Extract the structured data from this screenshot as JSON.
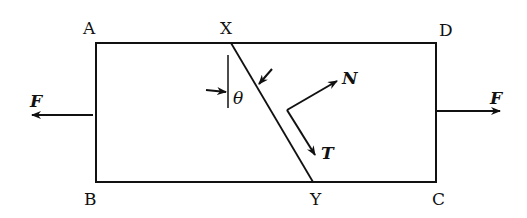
{
  "diagram": {
    "type": "stress element with inclined plane",
    "corner_labels": {
      "top_left": "A",
      "top_right": "D",
      "bottom_left": "B",
      "bottom_right": "C"
    },
    "plane_labels": {
      "top": "X",
      "bottom": "Y"
    },
    "forces": {
      "left": "F",
      "right": "F"
    },
    "angle_label": "θ",
    "normal_label": "N",
    "tangential_label": "T",
    "colors": {
      "ink": "#111111",
      "background": "#ffffff"
    }
  }
}
